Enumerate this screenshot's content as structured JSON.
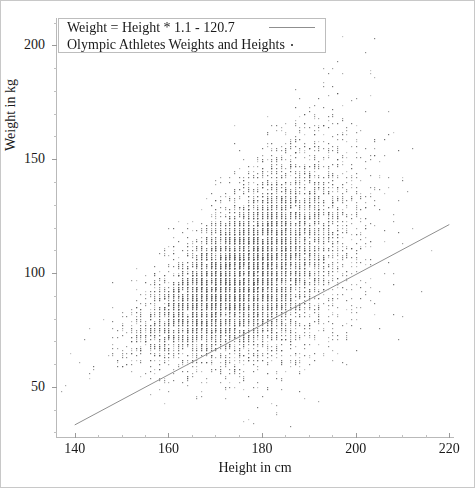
{
  "chart_data": {
    "type": "scatter",
    "title": "",
    "xlabel": "Height in cm",
    "ylabel": "Weight in kg",
    "xlim": [
      136,
      221
    ],
    "ylim": [
      28,
      212
    ],
    "xticks": [
      140,
      160,
      180,
      200,
      220
    ],
    "yticks": [
      50,
      100,
      150,
      200
    ],
    "x_minor_step": 5,
    "y_minor_step": 10,
    "grid": false,
    "legend_position": "top-left",
    "series": [
      {
        "name": "Weight = Height * 1.1 - 120.7",
        "type": "line",
        "marker": "line",
        "slope": 1.1,
        "intercept": -120.7,
        "x_start": 140,
        "y_start": 33.3,
        "x_end": 220,
        "y_end": 121.3,
        "color": "#8f8f8f"
      },
      {
        "name": "Olympic Athletes Weights and Heights",
        "type": "scatter",
        "marker": "dot",
        "color": "#555555",
        "point_count": 9800,
        "x_range": [
          137,
          218
        ],
        "y_range": [
          32,
          205
        ],
        "x_mean": 177,
        "y_mean": 75,
        "description": "Dense cloud of athlete height-weight pairs quantized to integer cm and kg, widening upward at greater heights"
      }
    ]
  },
  "axes": {
    "x": {
      "label": "Height in cm",
      "ticks": [
        {
          "value": 140,
          "label": "140"
        },
        {
          "value": 160,
          "label": "160"
        },
        {
          "value": 180,
          "label": "180"
        },
        {
          "value": 200,
          "label": "200"
        },
        {
          "value": 220,
          "label": "220"
        }
      ]
    },
    "y": {
      "label": "Weight in kg",
      "ticks": [
        {
          "value": 50,
          "label": "50"
        },
        {
          "value": 100,
          "label": "100"
        },
        {
          "value": 150,
          "label": "150"
        },
        {
          "value": 200,
          "label": "200"
        }
      ]
    }
  },
  "legend": {
    "entries": [
      {
        "label": "Weight = Height * 1.1 - 120.7",
        "key": "line-swatch"
      },
      {
        "label": "Olympic Athletes Weights and Heights",
        "key": "dot-swatch"
      }
    ]
  },
  "colors": {
    "point": "#555555",
    "line": "#8f8f8f",
    "axis": "#b9b9b9",
    "text": "#1a1a1a",
    "frame": "#c8c8c8"
  }
}
